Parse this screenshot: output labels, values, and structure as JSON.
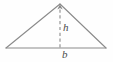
{
  "figure": {
    "kind": "triangle-area-diagram",
    "background_color": "#fefefe",
    "stroke_color": "#8a8a8a",
    "dash_color": "#8a8a8a",
    "label_color": "#4a4a4a",
    "labels": {
      "height": "h",
      "base": "b"
    },
    "geometry": {
      "apex": [
        60,
        4
      ],
      "left_vertex": [
        6,
        48
      ],
      "right_vertex": [
        106,
        48
      ],
      "height_foot": [
        60,
        48
      ],
      "arrow_tip": [
        60,
        5
      ],
      "arrow_direction": "up"
    }
  }
}
